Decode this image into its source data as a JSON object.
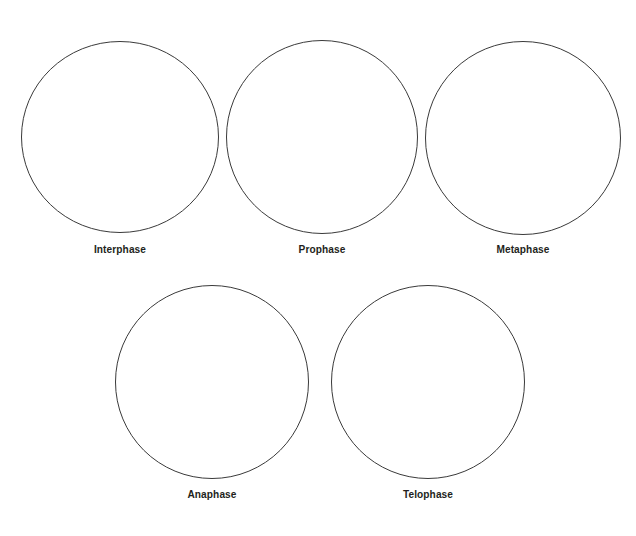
{
  "page": {
    "background_color": "#ffffff",
    "stroke_color": "#3a3a3a",
    "label_color": "#231f20",
    "width": 636,
    "height": 536
  },
  "worksheet": {
    "cells": [
      {
        "label": "Interphase",
        "row": 1,
        "cx": 120,
        "cy": 137,
        "rx": 99,
        "ry": 96,
        "label_y": 243
      },
      {
        "label": "Prophase",
        "row": 1,
        "cx": 322,
        "cy": 137,
        "rx": 96,
        "ry": 97,
        "label_y": 243
      },
      {
        "label": "Metaphase",
        "row": 1,
        "cx": 523,
        "cy": 138,
        "rx": 98,
        "ry": 97,
        "label_y": 243
      },
      {
        "label": "Anaphase",
        "row": 2,
        "cx": 212,
        "cy": 382,
        "rx": 97,
        "ry": 97,
        "label_y": 488
      },
      {
        "label": "Telophase",
        "row": 2,
        "cx": 428,
        "cy": 382,
        "rx": 97,
        "ry": 97,
        "label_y": 488
      }
    ]
  }
}
